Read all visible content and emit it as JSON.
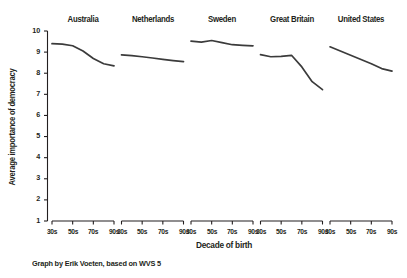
{
  "chart_data": {
    "type": "line",
    "title": "",
    "subtitle": "",
    "xlabel": "Decade of birth",
    "ylabel": "Average importance of democracy",
    "ylim": [
      1,
      10
    ],
    "yticks": [
      1,
      2,
      3,
      4,
      5,
      6,
      7,
      8,
      9,
      10
    ],
    "categories": [
      "30s",
      "40s",
      "50s",
      "60s",
      "70s",
      "80s",
      "90s"
    ],
    "xticklabels": [
      "30s",
      "50s",
      "70s",
      "90s"
    ],
    "grid": false,
    "legend": "none",
    "layout": "small-multiples, 5 panels in one row, shared y-axis",
    "line_color": "#3b3b3b",
    "series": [
      {
        "name": "Australia",
        "values": [
          9.4,
          9.38,
          9.3,
          9.05,
          8.7,
          8.45,
          8.35
        ]
      },
      {
        "name": "Netherlands",
        "values": [
          8.87,
          8.83,
          8.78,
          8.72,
          8.66,
          8.6,
          8.55
        ]
      },
      {
        "name": "Sweden",
        "values": [
          9.52,
          9.47,
          9.55,
          9.45,
          9.35,
          9.32,
          9.3
        ]
      },
      {
        "name": "Great Britain",
        "values": [
          8.88,
          8.78,
          8.8,
          8.85,
          8.3,
          7.6,
          7.22
        ]
      },
      {
        "name": "United States",
        "values": [
          9.25,
          9.05,
          8.85,
          8.65,
          8.45,
          8.22,
          8.1
        ]
      }
    ]
  },
  "caption": "Graph by Erik Voeten, based on WVS 5"
}
